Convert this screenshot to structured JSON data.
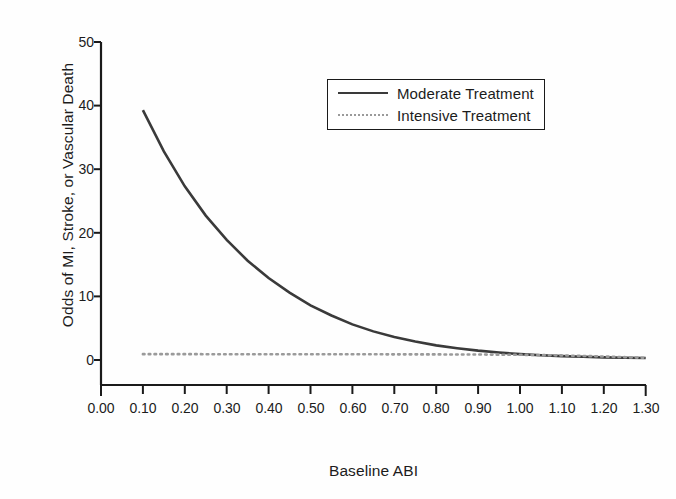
{
  "chart_data": {
    "type": "line",
    "title": "",
    "xlabel": "Baseline ABI",
    "ylabel": "Odds of MI, Stroke, or Vascular Death",
    "xlim": [
      0.0,
      1.3
    ],
    "ylim": [
      0,
      50
    ],
    "xticks": [
      "0.00",
      "0.10",
      "0.20",
      "0.30",
      "0.40",
      "0.50",
      "0.60",
      "0.70",
      "0.80",
      "0.90",
      "1.00",
      "1.10",
      "1.20",
      "1.30"
    ],
    "xtick_values": [
      0.0,
      0.1,
      0.2,
      0.3,
      0.4,
      0.5,
      0.6,
      0.7,
      0.8,
      0.9,
      1.0,
      1.1,
      1.2,
      1.3
    ],
    "yticks": [
      "0",
      "10",
      "20",
      "30",
      "40",
      "50"
    ],
    "ytick_values": [
      0,
      10,
      20,
      30,
      40,
      50
    ],
    "grid": false,
    "legend_position": "upper-right",
    "series": [
      {
        "name": "Moderate Treatment",
        "style": "solid",
        "color": "#3a3a3a",
        "x": [
          0.1,
          0.15,
          0.2,
          0.25,
          0.3,
          0.35,
          0.4,
          0.45,
          0.5,
          0.55,
          0.6,
          0.65,
          0.7,
          0.75,
          0.8,
          0.85,
          0.9,
          0.95,
          1.0,
          1.05,
          1.1,
          1.15,
          1.2,
          1.25,
          1.3
        ],
        "values": [
          39.3,
          32.8,
          27.3,
          22.7,
          18.9,
          15.6,
          12.9,
          10.6,
          8.6,
          7.0,
          5.6,
          4.5,
          3.6,
          2.9,
          2.3,
          1.85,
          1.47,
          1.17,
          0.93,
          0.75,
          0.61,
          0.5,
          0.42,
          0.36,
          0.31
        ]
      },
      {
        "name": "Intensive Treatment",
        "style": "dotted",
        "color": "#9a9a9a",
        "x": [
          0.1,
          0.2,
          0.3,
          0.4,
          0.5,
          0.6,
          0.7,
          0.8,
          0.9,
          1.0,
          1.1,
          1.2,
          1.3
        ],
        "values": [
          0.92,
          0.92,
          0.91,
          0.91,
          0.9,
          0.9,
          0.89,
          0.88,
          0.86,
          0.82,
          0.72,
          0.55,
          0.34
        ]
      }
    ],
    "annotations": [
      "Curves cross near Baseline ABI 0.95",
      "Moderate Treatment decays exponentially from ~39 to ~0.3"
    ]
  },
  "axes": {
    "x_title": "Baseline ABI",
    "y_title": "Odds of MI, Stroke, or Vascular Death"
  },
  "legend": {
    "entries": [
      {
        "label": "Moderate Treatment",
        "style": "solid"
      },
      {
        "label": "Intensive Treatment",
        "style": "dotted"
      }
    ]
  },
  "colors": {
    "moderate": "#3a3a3a",
    "intensive": "#9a9a9a",
    "axis": "#1a1a1a",
    "background": "#fefefe"
  }
}
